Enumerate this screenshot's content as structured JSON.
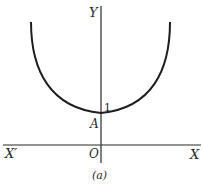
{
  "figure": {
    "caption": "(a)",
    "axes": {
      "y_label": "Y",
      "x_label": "X",
      "x_neg_label": "X′",
      "origin_label": "O"
    },
    "point": {
      "label": "A",
      "value_label": "1"
    },
    "curve": "catenary (U-shaped), minimum at A on Y-axis"
  },
  "colors": {
    "ink": "#2a2a2a",
    "background": "#ffffff"
  }
}
